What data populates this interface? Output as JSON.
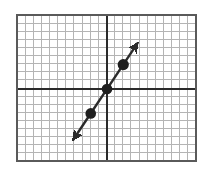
{
  "figure": {
    "type": "coordinate-grid-line-graph",
    "background_color": "#ffffff"
  },
  "chart_data": {
    "type": "line",
    "title": "",
    "xlabel": "",
    "ylabel": "",
    "grid": true,
    "legend": false,
    "legend_position": "none",
    "axis_labels_shown": false,
    "tick_labels_shown": false,
    "xlim": [
      -11,
      11
    ],
    "ylim": [
      -9,
      9
    ],
    "x_major_step": 1,
    "y_major_step": 1,
    "grid_columns": 22,
    "grid_rows": 18,
    "origin": {
      "x": 0,
      "y": 0
    },
    "series": [
      {
        "name": "line",
        "slope": 1.5,
        "intercept": 0,
        "equation": "y = 1.5x",
        "arrow_start": true,
        "arrow_end": true,
        "endpoints": [
          {
            "x": -4.2,
            "y": -6.3
          },
          {
            "x": 3.8,
            "y": 5.7
          }
        ],
        "points": [
          {
            "x": -2,
            "y": -3
          },
          {
            "x": 0,
            "y": 0
          },
          {
            "x": 2,
            "y": 3
          }
        ]
      }
    ]
  },
  "style": {
    "grid_line_color": "#b0b0b0",
    "grid_minor_color": "#c8c8c8",
    "axis_color": "#2b2b2b",
    "border_color": "#555555",
    "line_color": "#2b2b2b",
    "point_color": "#1f1f1f",
    "line_width": 2.4,
    "point_radius": 5.2
  },
  "geometry": {
    "plot_left": 17,
    "plot_top": 15,
    "plot_right": 196,
    "plot_bottom": 161,
    "cell_size": 8.13,
    "axis_x": 107,
    "axis_y": 89
  }
}
